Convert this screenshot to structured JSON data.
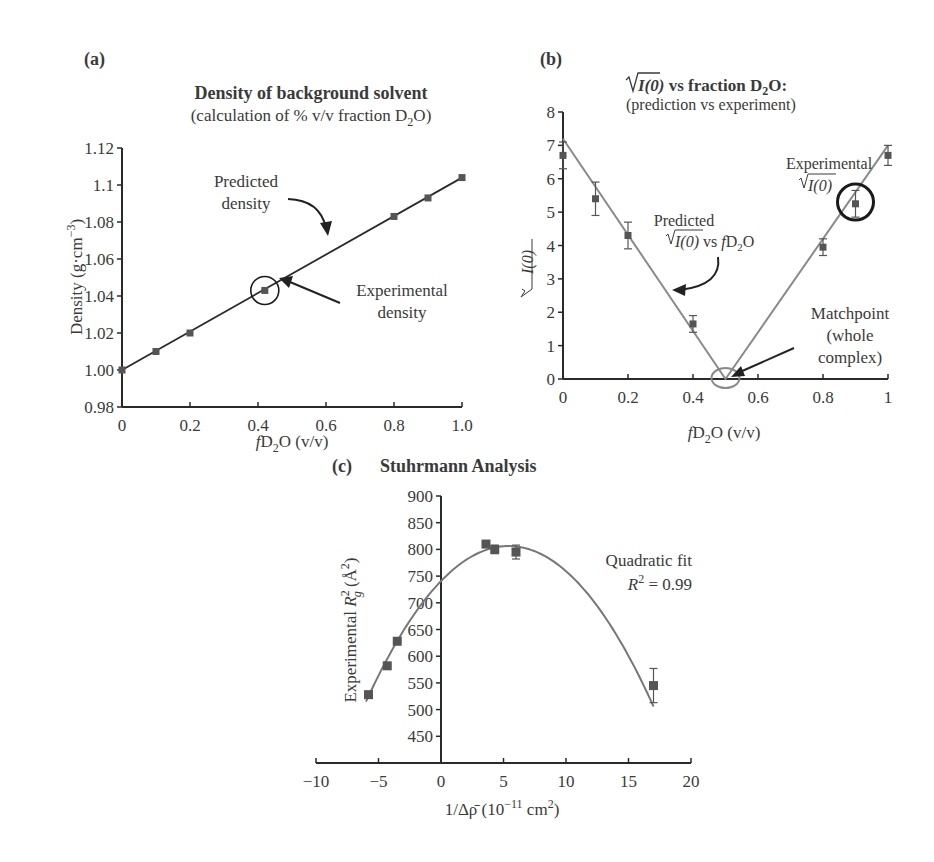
{
  "chart_data": [
    {
      "panel": "(a)",
      "type": "line",
      "title": "Density of background solvent",
      "subtitle": "(calculation of % v/v fraction D2O)",
      "xlabel": "fD2O (v/v)",
      "ylabel": "Density (g·cm−3)",
      "xlim": [
        0,
        1.0
      ],
      "ylim": [
        0.98,
        1.12
      ],
      "xticks": [
        "0",
        "0.2",
        "0.4",
        "0.6",
        "0.8",
        "1.0"
      ],
      "yticks": [
        "0.98",
        "1.00",
        "1.02",
        "1.04",
        "1.06",
        "1.08",
        "1.1",
        "1.12"
      ],
      "grid": false,
      "series": [
        {
          "name": "Predicted density",
          "style": "line",
          "x": [
            0,
            1.0
          ],
          "y": [
            1.0,
            1.104
          ]
        },
        {
          "name": "Experimental density",
          "style": "markers",
          "x": [
            0,
            0.1,
            0.2,
            0.42,
            0.8,
            0.9,
            1.0
          ],
          "y": [
            1.0,
            1.01,
            1.02,
            1.043,
            1.083,
            1.093,
            1.104
          ]
        }
      ],
      "annotations": [
        {
          "text": "Predicted density",
          "target": "line"
        },
        {
          "text": "Experimental density",
          "target": "circled point at x≈0.42"
        }
      ]
    },
    {
      "panel": "(b)",
      "type": "line",
      "title": "√I(0) vs fraction D2O:",
      "subtitle": "(prediction vs experiment)",
      "xlabel": "fD2O (v/v)",
      "ylabel": "√I(0)",
      "xlim": [
        0,
        1
      ],
      "ylim": [
        0,
        8
      ],
      "xticks": [
        "0",
        "0.2",
        "0.4",
        "0.6",
        "0.8",
        "1"
      ],
      "yticks": [
        "0",
        "1",
        "2",
        "3",
        "4",
        "5",
        "6",
        "7",
        "8"
      ],
      "grid": false,
      "series": [
        {
          "name": "Predicted √I(0) vs fD2O",
          "style": "line",
          "x": [
            0,
            0.5,
            1.0
          ],
          "y": [
            7.2,
            0,
            7.0
          ]
        },
        {
          "name": "Experimental √I(0)",
          "style": "markers-errorbars",
          "x": [
            0,
            0.1,
            0.2,
            0.4,
            0.8,
            0.9,
            1.0
          ],
          "y": [
            6.7,
            5.4,
            4.3,
            1.65,
            3.95,
            5.25,
            6.7
          ],
          "err": [
            0.4,
            0.5,
            0.4,
            0.25,
            0.25,
            0.4,
            0.3
          ]
        }
      ],
      "annotations": [
        {
          "text": "Experimental √I(0)",
          "target": "circled point at x=0.9"
        },
        {
          "text": "Predicted √I(0) vs fD2O",
          "target": "left line"
        },
        {
          "text": "Matchpoint (whole complex)",
          "target": "x=0.5, y=0"
        }
      ]
    },
    {
      "panel": "(c)",
      "type": "scatter",
      "title": "Stuhrmann Analysis",
      "xlabel": "1/Δρ̄ (10−11 cm2)",
      "ylabel": "Experimental Rg2 (Å2)",
      "xlim": [
        -10,
        20
      ],
      "ylim": [
        400,
        900
      ],
      "xticks": [
        "−10",
        "−5",
        "0",
        "5",
        "10",
        "15",
        "20"
      ],
      "yticks": [
        "450",
        "500",
        "550",
        "600",
        "650",
        "700",
        "750",
        "800",
        "850",
        "900"
      ],
      "grid": false,
      "series": [
        {
          "name": "Experimental Rg2",
          "style": "markers-errorbars",
          "x": [
            -5.8,
            -4.3,
            -3.5,
            3.6,
            4.3,
            6.0,
            17.0
          ],
          "y": [
            528,
            582,
            628,
            810,
            800,
            795,
            545
          ],
          "err": [
            0,
            0,
            0,
            0,
            8,
            13,
            32
          ]
        },
        {
          "name": "Quadratic fit",
          "style": "curve",
          "r2": 0.99,
          "x": [
            -6,
            -4,
            -2,
            0,
            2,
            4,
            6,
            8,
            10,
            12,
            14,
            16,
            17
          ],
          "y": [
            527,
            603,
            675,
            735,
            778,
            803,
            808,
            795,
            763,
            712,
            643,
            555,
            500
          ]
        }
      ],
      "annotations": [
        {
          "text": "Quadratic fit",
          "line2": "R2 = 0.99"
        }
      ]
    }
  ],
  "labels": {
    "a": {
      "panel": "(a)",
      "title": "Density of background solvent",
      "subtitle_pre": "(calculation of % v/v fraction D",
      "subtitle_sub": "2",
      "subtitle_post": "O)",
      "ylabel_pre": "Density (g·cm",
      "ylabel_sup": "−3",
      "ylabel_post": ")",
      "xlabel_f": "f",
      "xlabel_mid": "D",
      "xlabel_sub": "2",
      "xlabel_post": "O (v/v)",
      "ann_pred_1": "Predicted",
      "ann_pred_2": "density",
      "ann_exp_1": "Experimental",
      "ann_exp_2": "density"
    },
    "b": {
      "panel": "(b)",
      "title_root": "I(0)",
      "title_post": " vs fraction D",
      "title_sub": "2",
      "title_end": "O:",
      "subtitle": "(prediction vs experiment)",
      "ylabel": "I(0)",
      "xlabel_f": "f",
      "xlabel_mid": "D",
      "xlabel_sub": "2",
      "xlabel_post": "O (v/v)",
      "ann_exp_1": "Experimental",
      "ann_exp_2": "I(0)",
      "ann_pred_1": "Predicted",
      "ann_pred_2": "I(0)",
      "ann_pred_3": " vs ",
      "ann_pred_f": "f",
      "ann_pred_d": "D",
      "ann_pred_sub": "2",
      "ann_pred_o": "O",
      "ann_match_1": "Matchpoint",
      "ann_match_2": "(whole",
      "ann_match_3": "complex)"
    },
    "c": {
      "panel": "(c)",
      "title": "Stuhrmann Analysis",
      "ylabel_pre": "Experimental ",
      "ylabel_R": "R",
      "ylabel_sup": "2",
      "ylabel_sub": "g",
      "ylabel_post": " (Å",
      "ylabel_sup2": "2",
      "ylabel_end": ")",
      "xlabel_pre": "1/Δρ̄ (10",
      "xlabel_sup": "−11",
      "xlabel_mid": " cm",
      "xlabel_sup2": "2",
      "xlabel_end": ")",
      "fit_1": "Quadratic fit",
      "fit_R": "R",
      "fit_sup": "2",
      "fit_val": " = 0.99"
    }
  },
  "colors": {
    "axis": "#2a2a2a",
    "line_a": "#2a2a2a",
    "line_b": "#8a8a8a",
    "marker": "#555555",
    "curve_c": "#777777",
    "circle_dark": "#1a1a1a",
    "circle_gray": "#8a8a8a"
  }
}
